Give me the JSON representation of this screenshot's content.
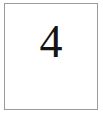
{
  "canvas": {
    "width": 103,
    "height": 121,
    "background_color": "#ffffff"
  },
  "card": {
    "name": "bordered-page",
    "border_color": "#9a9a9a",
    "border_width": 1,
    "background_color": "#ffffff"
  },
  "content": {
    "numeral": "4",
    "numeral_color": "#141414"
  }
}
